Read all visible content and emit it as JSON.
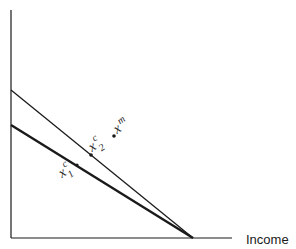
{
  "diagram": {
    "x_axis_label": "Income",
    "colors": {
      "ink": "#1a1a1a",
      "background": "#ffffff"
    },
    "lines": [
      {
        "name": "upper-budget-line",
        "weight": "thin"
      },
      {
        "name": "lower-budget-line",
        "weight": "thick"
      }
    ],
    "points": [
      {
        "name": "x2c",
        "base": "x",
        "sup": "c",
        "sub": "2"
      },
      {
        "name": "xm",
        "base": "x",
        "sup": "m",
        "sub": ""
      },
      {
        "name": "x1c",
        "base": "x",
        "sup": "c",
        "sub": "1"
      }
    ]
  }
}
